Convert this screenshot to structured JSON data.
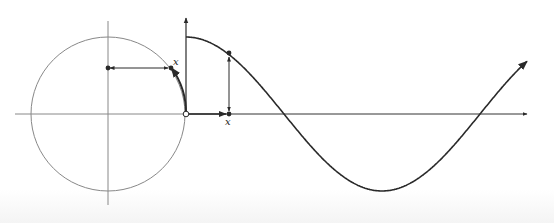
{
  "diagram": {
    "labels": {
      "circle_point_label": "x",
      "axis_point_label": "x"
    },
    "colors": {
      "thin_line": "#777777",
      "thick_line": "#2a2a2a",
      "background": "#ffffff"
    },
    "geometry": {
      "circle_center": [
        108,
        114
      ],
      "circle_radius": 77,
      "graph_origin": [
        186,
        114
      ],
      "quarter_period_px": 98,
      "amplitude_px": 77,
      "x_axis_end": 527,
      "y_axis_top": 21
    },
    "elements": [
      "unit-circle",
      "circle-axes",
      "arc-x",
      "horizontal-projection-arrow",
      "cosine-curve",
      "graph-y-axis",
      "graph-x-axis",
      "vertical-projection-arrow",
      "x-distance-arrow"
    ]
  }
}
